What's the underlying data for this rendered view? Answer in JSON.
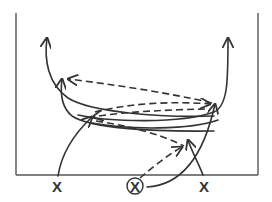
{
  "diagram": {
    "type": "basketball-play",
    "colors": {
      "line": "#333333",
      "court": "#555555",
      "background": "#ffffff"
    },
    "players": [
      {
        "id": "left",
        "label": "X",
        "circled": false
      },
      {
        "id": "ball",
        "label": "X",
        "circled": true
      },
      {
        "id": "right",
        "label": "X",
        "circled": false
      }
    ],
    "legend": {
      "solid": "player movement",
      "dashed": "pass"
    }
  }
}
